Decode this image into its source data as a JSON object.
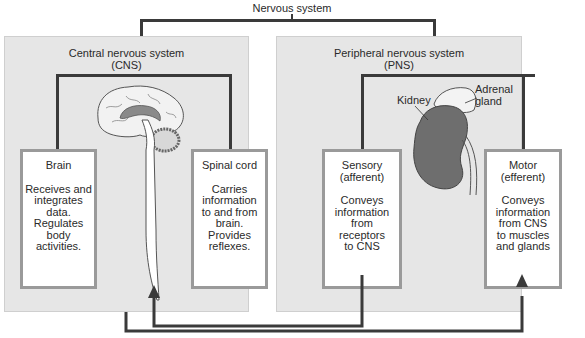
{
  "diagram": {
    "root": {
      "label": "Nervous system"
    },
    "cns": {
      "title": "Central nervous system",
      "abbr": "(CNS)",
      "illustration": "brain-and-spinal-cord",
      "boxes": [
        {
          "heading": "Brain",
          "description": "Receives and\nintegrates\ndata.\nRegulates\nbody\nactivities."
        },
        {
          "heading": "Spinal cord",
          "description": "Carries\ninformation\nto and from\nbrain.\nProvides\nreflexes."
        }
      ]
    },
    "pns": {
      "title": "Peripheral nervous system",
      "abbr": "(PNS)",
      "illustration": "kidney-and-adrenal-gland",
      "illustration_labels": {
        "kidney": "Kidney",
        "adrenal": "Adrenal\ngland"
      },
      "boxes": [
        {
          "heading": "Sensory\n(afferent)",
          "description": "Conveys\ninformation\nfrom\nreceptors\nto CNS"
        },
        {
          "heading": "Motor\n(efferent)",
          "description": "Conveys\ninformation\nfrom CNS\nto muscles\nand glands"
        }
      ]
    },
    "connections": [
      {
        "from": "Sensory (afferent)",
        "to": "Central nervous system (CNS)"
      },
      {
        "from": "Central nervous system (CNS)",
        "to": "Motor (efferent)"
      }
    ],
    "colors": {
      "panel_bg": "#e6e6e6",
      "box_border": "#9a9a9a",
      "line": "#3a3a3a",
      "kidney": "#6e6e6e",
      "brain_inner": "#7a7a7a"
    }
  }
}
